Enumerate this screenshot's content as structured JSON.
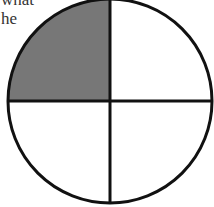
{
  "text": {
    "line1": "what",
    "line2": "he"
  },
  "diagram": {
    "type": "fraction-circle",
    "parts": 4,
    "shaded_parts": 1,
    "shaded_quadrant": "top-left",
    "shade_color": "#777777",
    "stroke_color": "#111111",
    "background": "#ffffff"
  }
}
